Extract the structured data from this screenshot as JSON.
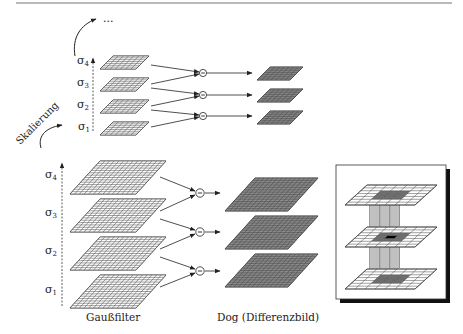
{
  "top_dots": "...",
  "scale_label": "Skalierung",
  "small_octave": {
    "sigmas": [
      {
        "label": "σ",
        "sub": "4"
      },
      {
        "label": "σ",
        "sub": "3"
      },
      {
        "label": "σ",
        "sub": "2"
      },
      {
        "label": "σ",
        "sub": "1"
      }
    ]
  },
  "large_octave": {
    "sigmas": [
      {
        "label": "σ",
        "sub": "4"
      },
      {
        "label": "σ",
        "sub": "3"
      },
      {
        "label": "σ",
        "sub": "2"
      },
      {
        "label": "σ",
        "sub": "1"
      }
    ]
  },
  "minus_symbol": "−",
  "captions": {
    "gauss": "Gaußfilter",
    "dog": "Dog (Differenzbild)"
  },
  "colors": {
    "grid_light": "#ffffff",
    "grid_dark": "#8a8a8a",
    "grid_line": "#444444",
    "inset_highlight": "#6f6f6f",
    "inset_center": "#000000",
    "inset_column": "#b5b5b5"
  }
}
